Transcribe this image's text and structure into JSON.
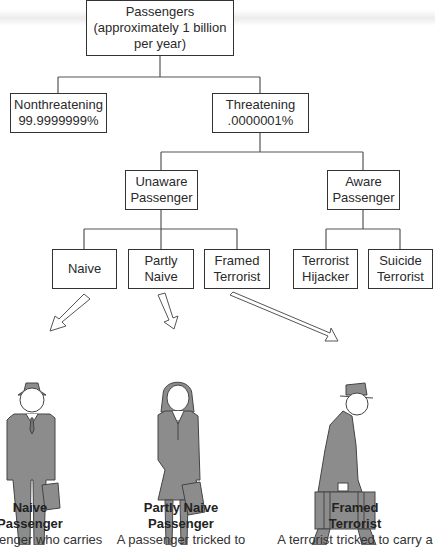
{
  "diagram": {
    "root": {
      "lines": [
        "Passengers",
        "(approximately 1 billion",
        "per year)"
      ]
    },
    "level1": [
      {
        "lines": [
          "Nonthreatening",
          "99.9999999%"
        ]
      },
      {
        "lines": [
          "Threatening",
          ".0000001%"
        ]
      }
    ],
    "level2": [
      {
        "lines": [
          "Unaware",
          "Passenger"
        ]
      },
      {
        "lines": [
          "Aware",
          "Passenger"
        ]
      }
    ],
    "level3": [
      {
        "lines": [
          "Naive"
        ]
      },
      {
        "lines": [
          "Partly",
          "Naive"
        ]
      },
      {
        "lines": [
          "Framed",
          "Terrorist"
        ]
      },
      {
        "lines": [
          "Terrorist",
          "Hijacker"
        ]
      },
      {
        "lines": [
          "Suicide",
          "Terrorist"
        ]
      }
    ]
  },
  "figures": [
    {
      "icon": "man-with-hat-and-briefcase-icon",
      "title": [
        "Naive",
        "Passenger"
      ],
      "desc": "A passenger who carries"
    },
    {
      "icon": "woman-with-briefcase-icon",
      "title": [
        "Partly Naive",
        "Passenger"
      ],
      "desc": "A passenger tricked to"
    },
    {
      "icon": "man-in-coat-with-suitcase-icon",
      "title": [
        "Framed",
        "Terrorist"
      ],
      "desc": "A terrorist tricked to carry a"
    }
  ],
  "colors": {
    "figure_fill": "#8c8c8c",
    "figure_stroke": "#444444",
    "box_border": "#333333"
  }
}
